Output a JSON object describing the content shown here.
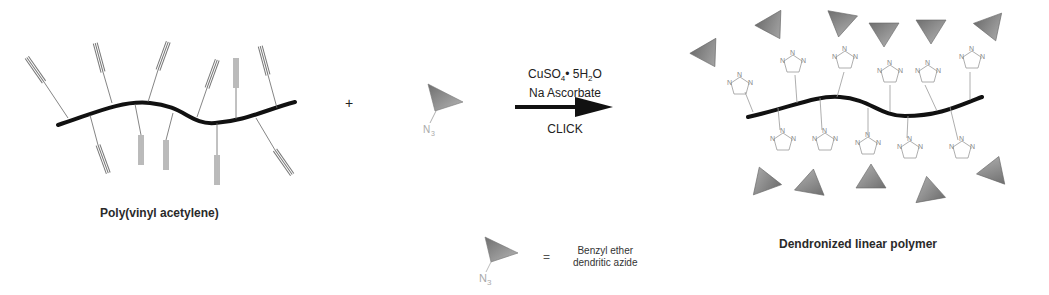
{
  "scheme": {
    "reactant": {
      "name": "Poly(vinyl acetylene)"
    },
    "plus_sign": "+",
    "reagent": {
      "azide_label": "N",
      "azide_subscript": "3"
    },
    "arrow": {
      "condition_line1_a": "CuSO",
      "condition_line1_sub": "4",
      "condition_line1_b": "• 5H",
      "condition_line1_sub2": "2",
      "condition_line1_c": "O",
      "condition_line2": "Na Ascorbate",
      "condition_below": "CLICK"
    },
    "product": {
      "name": "Dendronized linear polymer",
      "triazole_atom": "N"
    },
    "legend": {
      "equals": "=",
      "azide_label": "N",
      "azide_subscript": "3",
      "description_line1": "Benzyl ether",
      "description_line2": "dendritic azide"
    },
    "colors": {
      "backbone": "#111111",
      "dendron_fill": "#8a8a8a",
      "alkyne_line": "#777777",
      "triazole_line": "#888888"
    }
  }
}
